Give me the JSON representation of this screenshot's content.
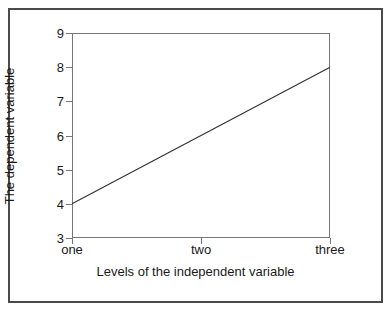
{
  "figure": {
    "background_color": "#ffffff",
    "frame_color": "#4a4a4a",
    "axis_color": "#777777",
    "line_color": "#333333",
    "text_color": "#1a1a1a"
  },
  "chart_data": {
    "type": "line",
    "title": "",
    "xlabel": "Levels of the independent variable",
    "ylabel": "The dependent variable",
    "categories": [
      "one",
      "two",
      "three"
    ],
    "values": [
      4,
      6,
      8
    ],
    "series": [
      {
        "name": "",
        "values": [
          4,
          6,
          8
        ]
      }
    ],
    "ylim": [
      3,
      9
    ],
    "yticks": [
      3,
      4,
      5,
      6,
      7,
      8,
      9
    ],
    "ytick_labels": [
      "3",
      "4",
      "5",
      "6",
      "7",
      "8",
      "9"
    ],
    "xticks": [
      "one",
      "two",
      "three"
    ],
    "xtick_labels": [
      "one",
      "two",
      "three"
    ],
    "grid": false,
    "legend": false,
    "legend_position": "none",
    "markers": false,
    "annotations": []
  }
}
